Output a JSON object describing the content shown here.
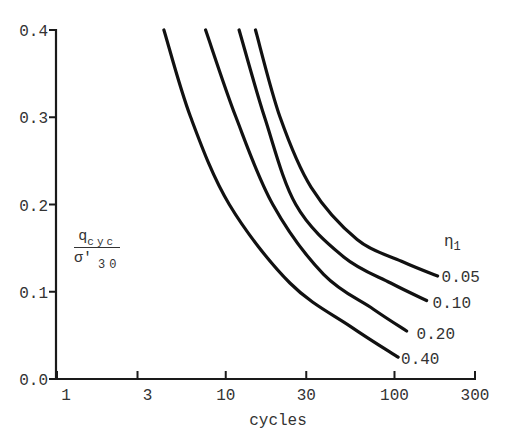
{
  "chart_data": {
    "type": "line",
    "title": "",
    "xlabel": "cycles",
    "ylabel": "q_cyc / σ'_30",
    "ylabel_parts": {
      "numerator": "q",
      "numerator_sub": "cyc",
      "denominator": "σ'",
      "denominator_sub": "30"
    },
    "xscale": "log",
    "xlim": [
      1,
      300
    ],
    "ylim": [
      0.0,
      0.4
    ],
    "x_ticks": [
      1,
      3,
      10,
      30,
      100,
      300
    ],
    "x_tick_labels": [
      "1",
      "3",
      "10",
      "30",
      "100",
      "300"
    ],
    "y_ticks": [
      0.0,
      0.1,
      0.2,
      0.3,
      0.4
    ],
    "y_tick_labels": [
      "0.0",
      "0.1",
      "0.2",
      "0.3",
      "0.4"
    ],
    "grid": false,
    "legend_title": "η1",
    "legend_position": "inline at curve ends (right)",
    "series": [
      {
        "name": "0.05",
        "x": [
          15,
          21,
          32,
          60,
          110,
          180
        ],
        "y": [
          0.4,
          0.3,
          0.22,
          0.16,
          0.135,
          0.118
        ]
      },
      {
        "name": "0.10",
        "x": [
          12,
          17,
          26,
          50,
          95,
          155
        ],
        "y": [
          0.4,
          0.3,
          0.2,
          0.14,
          0.11,
          0.09
        ]
      },
      {
        "name": "0.20",
        "x": [
          7.6,
          11.5,
          19,
          38,
          75,
          118
        ],
        "y": [
          0.4,
          0.3,
          0.2,
          0.12,
          0.08,
          0.055
        ]
      },
      {
        "name": "0.40",
        "x": [
          4.3,
          6.2,
          10.5,
          24,
          55,
          105
        ],
        "y": [
          0.4,
          0.3,
          0.2,
          0.11,
          0.06,
          0.025
        ]
      }
    ]
  }
}
